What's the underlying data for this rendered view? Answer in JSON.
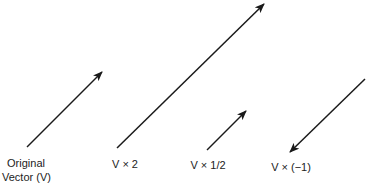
{
  "diagram": {
    "stroke_color": "#1a1a1a",
    "vectors": [
      {
        "id": "original",
        "label_line1": "Original",
        "label_line2": "Vector (V)",
        "scalar": "1",
        "x1": 27,
        "y1": 147,
        "x2": 102,
        "y2": 72
      },
      {
        "id": "times-2",
        "label": "V × 2",
        "scalar": "2",
        "x1": 117,
        "y1": 148,
        "x2": 264,
        "y2": 4
      },
      {
        "id": "times-half",
        "label": "V × 1/2",
        "scalar": "1/2",
        "x1": 207,
        "y1": 150,
        "x2": 246,
        "y2": 111
      },
      {
        "id": "times-neg1",
        "label": "V × (−1)",
        "scalar": "-1",
        "x1": 365,
        "y1": 79,
        "x2": 290,
        "y2": 152
      }
    ]
  }
}
